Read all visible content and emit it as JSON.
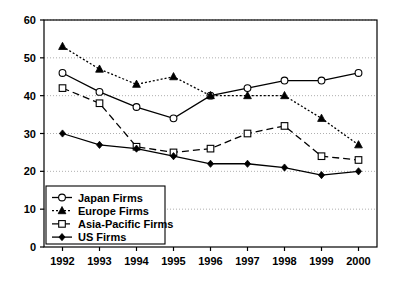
{
  "chart_data": {
    "type": "line",
    "title": "",
    "xlabel": "",
    "ylabel": "",
    "categories": [
      "1992",
      "1993",
      "1994",
      "1995",
      "1996",
      "1997",
      "1998",
      "1999",
      "2000"
    ],
    "ylim": [
      0,
      60
    ],
    "yticks": [
      0,
      10,
      20,
      30,
      40,
      50,
      60
    ],
    "ytick_labels": [
      "0",
      "10",
      "20",
      "30",
      "40",
      "50",
      "60"
    ],
    "grid": true,
    "legend_position": "bottom-left",
    "series": [
      {
        "name": "Japan Firms",
        "marker": "open-circle",
        "linestyle": "solid",
        "color": "#000000",
        "values": [
          46,
          41,
          37,
          34,
          40,
          42,
          44,
          44,
          46
        ]
      },
      {
        "name": "Europe Firms",
        "marker": "filled-triangle",
        "linestyle": "dotted",
        "color": "#000000",
        "values": [
          53,
          47,
          43,
          45,
          40,
          40,
          40,
          34,
          27
        ]
      },
      {
        "name": "Asia-Pacific Firms",
        "marker": "open-square",
        "linestyle": "dashed",
        "color": "#000000",
        "values": [
          42,
          38,
          26.5,
          25,
          26,
          30,
          32,
          24,
          23
        ]
      },
      {
        "name": "US Firms",
        "marker": "filled-diamond",
        "linestyle": "solid",
        "color": "#000000",
        "values": [
          30,
          27,
          26,
          24,
          22,
          22,
          21,
          19,
          20
        ]
      }
    ]
  },
  "legend": {
    "items": [
      {
        "label": "Japan Firms",
        "marker": "open-circle",
        "linestyle": "solid"
      },
      {
        "label": "Europe Firms",
        "marker": "filled-triangle",
        "linestyle": "dotted"
      },
      {
        "label": "Asia-Pacific Firms",
        "marker": "open-square",
        "linestyle": "dashed"
      },
      {
        "label": "US Firms",
        "marker": "filled-diamond",
        "linestyle": "solid"
      }
    ]
  }
}
